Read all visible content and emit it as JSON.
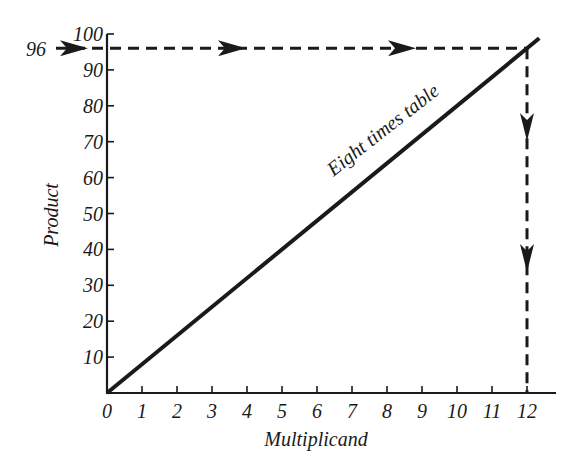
{
  "chart_data": {
    "type": "line",
    "title": "",
    "xlabel": "Multiplicand",
    "ylabel": "Product",
    "x": [
      0,
      1,
      2,
      3,
      4,
      5,
      6,
      7,
      8,
      9,
      10,
      11,
      12
    ],
    "series": [
      {
        "name": "Eight times table",
        "values": [
          0,
          8,
          16,
          24,
          32,
          40,
          48,
          56,
          64,
          72,
          80,
          88,
          96
        ]
      }
    ],
    "xticks": [
      "0",
      "1",
      "2",
      "3",
      "4",
      "5",
      "6",
      "7",
      "8",
      "9",
      "10",
      "11",
      "12"
    ],
    "yticks": [
      "10",
      "20",
      "30",
      "40",
      "50",
      "60",
      "70",
      "80",
      "90",
      "100"
    ],
    "xlim": [
      0,
      12.8
    ],
    "ylim": [
      0,
      100
    ],
    "grid": false,
    "legend": null,
    "annotations": [
      {
        "text": "Eight times table",
        "type": "line-label",
        "rotation_deg": -38
      },
      {
        "text": "96",
        "type": "y-marker",
        "value": 96,
        "description": "dashed line with arrows from y=96 horizontally to the line, then down to x=12"
      }
    ],
    "lookup": {
      "input_y": 96,
      "output_x": 12
    }
  },
  "labels": {
    "x_axis": "Multiplicand",
    "y_axis": "Product",
    "line_label": "Eight times table",
    "marker_value": "96"
  }
}
